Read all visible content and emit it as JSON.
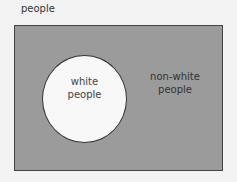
{
  "diagram": {
    "universe_label": "people",
    "inner_set": {
      "line1": "white",
      "line2": "people"
    },
    "complement": {
      "line1": "non-white",
      "line2": "people"
    },
    "colors": {
      "universe_fill": "#9b9b9b",
      "set_fill": "#f8f8f8",
      "border": "#333333"
    }
  }
}
